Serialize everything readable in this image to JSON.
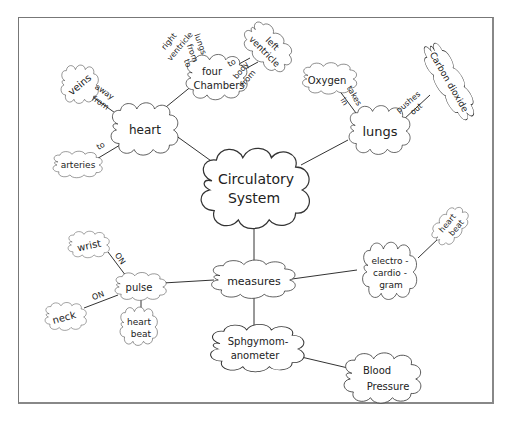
{
  "diagram": {
    "type": "concept-map",
    "style": "hand-drawn clouds",
    "central_node": "Circulatory System",
    "nodes": {
      "circulatory_system": {
        "lines": [
          "Circulatory",
          "System"
        ]
      },
      "heart": {
        "lines": [
          "heart"
        ]
      },
      "four_chambers": {
        "lines": [
          "four",
          "Chambers"
        ]
      },
      "left_ventricle": {
        "lines": [
          "left",
          "ventricle"
        ]
      },
      "veins": {
        "lines": [
          "veins"
        ]
      },
      "arteries": {
        "lines": [
          "arteries"
        ]
      },
      "lungs": {
        "lines": [
          "lungs"
        ]
      },
      "oxygen": {
        "lines": [
          "Oxygen"
        ]
      },
      "carbon_dioxide": {
        "lines": [
          "Carbon dioxide"
        ]
      },
      "measures": {
        "lines": [
          "measures"
        ]
      },
      "pulse": {
        "lines": [
          "pulse"
        ]
      },
      "wrist": {
        "lines": [
          "wrist"
        ]
      },
      "neck": {
        "lines": [
          "neck"
        ]
      },
      "pulse_heart_beat": {
        "lines": [
          "heart",
          "beat"
        ]
      },
      "ecg": {
        "lines": [
          "electro -",
          "cardio -",
          "gram"
        ]
      },
      "ecg_heart_beat": {
        "lines": [
          "heart",
          "beat"
        ]
      },
      "sphygmomanometer": {
        "lines": [
          "Sphgymom-",
          "anometer"
        ]
      },
      "blood_pressure": {
        "lines": [
          "Blood",
          "Pressure"
        ]
      }
    },
    "links": {
      "heart_veins": [
        "away",
        "from"
      ],
      "heart_arteries": [
        "to"
      ],
      "four_chambers_right_ventricle": [
        "right",
        "ventricle",
        "lungs",
        "from",
        "to"
      ],
      "four_chambers_left_ventricle_to": [
        "to"
      ],
      "four_chambers_left_ventricle_body": [
        "body",
        "from"
      ],
      "lungs_oxygen": [
        "takes",
        "in"
      ],
      "lungs_co2": [
        "pushes",
        "out"
      ],
      "pulse_wrist": [
        "ON"
      ],
      "pulse_neck": [
        "ON"
      ]
    },
    "edges": [
      [
        "circulatory_system",
        "heart"
      ],
      [
        "circulatory_system",
        "lungs"
      ],
      [
        "circulatory_system",
        "measures"
      ],
      [
        "heart",
        "four_chambers"
      ],
      [
        "heart",
        "veins"
      ],
      [
        "heart",
        "arteries"
      ],
      [
        "four_chambers",
        "left_ventricle"
      ],
      [
        "lungs",
        "oxygen"
      ],
      [
        "lungs",
        "carbon_dioxide"
      ],
      [
        "measures",
        "pulse"
      ],
      [
        "measures",
        "ecg"
      ],
      [
        "measures",
        "sphygmomanometer"
      ],
      [
        "pulse",
        "wrist"
      ],
      [
        "pulse",
        "neck"
      ],
      [
        "pulse",
        "pulse_heart_beat"
      ],
      [
        "ecg",
        "ecg_heart_beat"
      ],
      [
        "sphygmomanometer",
        "blood_pressure"
      ]
    ]
  }
}
